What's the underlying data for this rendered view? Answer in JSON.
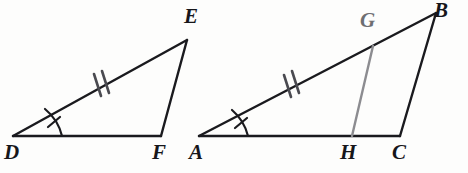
{
  "figure": {
    "background_color": "#fdfdfc",
    "stroke_color": "#1a1a1e",
    "gray_stroke_color": "#8c8c90",
    "width": 468,
    "height": 173
  },
  "triangles": [
    {
      "name": "triangle-def",
      "vertices": [
        {
          "label": "D",
          "x": 13,
          "y": 136,
          "label_x": 4,
          "label_y": 142,
          "color": "#16161a"
        },
        {
          "label": "E",
          "x": 187,
          "y": 40,
          "label_x": 184,
          "label_y": 6,
          "color": "#16161a"
        },
        {
          "label": "F",
          "x": 161,
          "y": 136,
          "label_x": 152,
          "label_y": 142,
          "color": "#16161a"
        }
      ],
      "sides": [
        {
          "name": "side-DE",
          "from": "D",
          "to": "E",
          "ticks": 2
        },
        {
          "name": "side-EF",
          "from": "E",
          "to": "F",
          "ticks": 0
        },
        {
          "name": "side-DF",
          "from": "D",
          "to": "F",
          "ticks": 0
        }
      ],
      "angle_marks": [
        {
          "name": "angle-D",
          "at": "D",
          "ticks": 1
        }
      ]
    },
    {
      "name": "triangle-abc",
      "vertices": [
        {
          "label": "A",
          "x": 199,
          "y": 136,
          "label_x": 189,
          "label_y": 142,
          "color": "#16161a"
        },
        {
          "label": "B",
          "x": 436,
          "y": 13,
          "label_x": 434,
          "label_y": 0,
          "color": "#16161a"
        },
        {
          "label": "C",
          "x": 400,
          "y": 136,
          "label_x": 392,
          "label_y": 142,
          "color": "#16161a"
        },
        {
          "label": "G",
          "x": 373,
          "y": 46,
          "label_x": 360,
          "label_y": 10,
          "color": "#6e6e72"
        },
        {
          "label": "H",
          "x": 352,
          "y": 136,
          "label_x": 340,
          "label_y": 142,
          "color": "#16161a"
        }
      ],
      "sides": [
        {
          "name": "side-AB",
          "from": "A",
          "to": "B",
          "ticks": 2
        },
        {
          "name": "side-BC",
          "from": "B",
          "to": "C",
          "ticks": 0
        },
        {
          "name": "side-AC",
          "from": "A",
          "to": "C",
          "ticks": 0
        }
      ],
      "cevian": {
        "name": "segment-GH",
        "from": "G",
        "to": "H",
        "color": "#8c8c90"
      },
      "angle_marks": [
        {
          "name": "angle-A",
          "at": "A",
          "ticks": 1
        }
      ]
    }
  ],
  "labels": {
    "D": "D",
    "E": "E",
    "F": "F",
    "A": "A",
    "B": "B",
    "C": "C",
    "G": "G",
    "H": "H"
  }
}
